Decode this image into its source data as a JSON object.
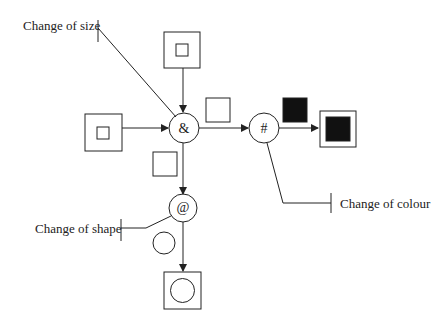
{
  "diagram": {
    "operators": {
      "combine": {
        "symbol": "&"
      },
      "colour": {
        "symbol": "#"
      },
      "shape": {
        "symbol": "@"
      }
    },
    "labels": {
      "size": "Change of size",
      "colour": "Change of colour",
      "shape": "Change of shape"
    },
    "colors": {
      "stroke": "#222222",
      "fill_dark": "#111111",
      "background": "#ffffff"
    }
  }
}
